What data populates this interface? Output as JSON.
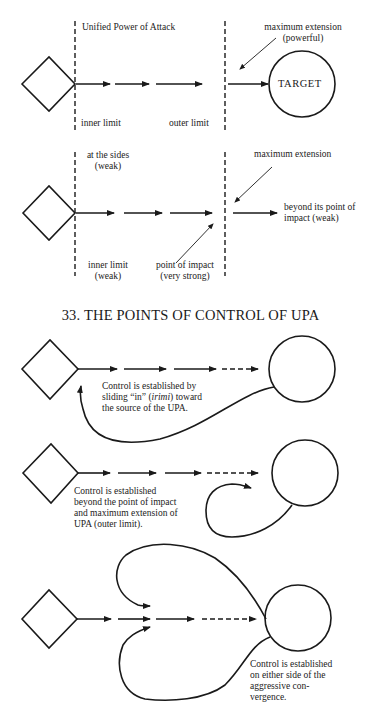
{
  "figure_title": "33. THE POINTS OF CONTROL OF UPA",
  "diagram1": {
    "header": "Unified Power of Attack",
    "max_ext_line1": "maximum extension",
    "max_ext_line2": "(powerful)",
    "target": "TARGET",
    "inner_limit": "inner limit",
    "outer_limit": "outer limit"
  },
  "diagram2": {
    "sides_line1": "at the sides",
    "sides_line2": "(weak)",
    "max_ext": "maximum extension",
    "beyond_line1": "beyond its point of",
    "beyond_line2": "impact (weak)",
    "inner_line1": "inner limit",
    "inner_line2": "(weak)",
    "impact_line1": "point of impact",
    "impact_line2": "(very strong)"
  },
  "control1": {
    "line1": "Control is established by",
    "line2_pre": "sliding “in” (",
    "line2_em": "irimi",
    "line2_post": ") toward",
    "line3": "the source of the UPA."
  },
  "control2": {
    "line1": "Control is established",
    "line2": "beyond the point of impact",
    "line3": "and maximum extension of",
    "line4": "UPA (outer limit)."
  },
  "control3": {
    "line1": "Control is established",
    "line2": "on either side of the",
    "line3": "aggressive con-",
    "line4": "vergence."
  },
  "colors": {
    "ink": "#1a1a1a",
    "background": "#ffffff"
  }
}
